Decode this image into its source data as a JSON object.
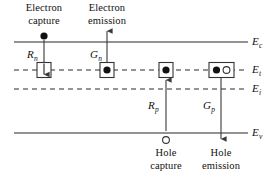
{
  "figure": {
    "background_color": "#ffffff",
    "line_color": "#6f6f6f",
    "dash_color": "#2a2a2a",
    "arrow_color": "#3a3a3a",
    "text_color": "#111111"
  },
  "energy_levels": [
    {
      "id": "Ec",
      "symbol": "E",
      "subscript": "c",
      "style": "solid",
      "y": 42,
      "x_start": 14,
      "x_end": 248,
      "label_x": 252,
      "label_y": 36
    },
    {
      "id": "Et",
      "symbol": "E",
      "subscript": "t",
      "style": "dashed",
      "y": 70,
      "x_start": 14,
      "x_end": 248,
      "label_x": 252,
      "label_y": 64
    },
    {
      "id": "Ei",
      "symbol": "E",
      "subscript": "i",
      "style": "dashed",
      "y": 89,
      "x_start": 14,
      "x_end": 248,
      "label_x": 252,
      "label_y": 83
    },
    {
      "id": "Ev",
      "symbol": "E",
      "subscript": "v",
      "style": "solid",
      "y": 133,
      "x_start": 14,
      "x_end": 248,
      "label_x": 252,
      "label_y": 127
    }
  ],
  "processes": [
    {
      "id": "electron-capture",
      "caption_line1": "Electron",
      "caption_line2": "capture",
      "caption_x": 44,
      "caption_y": 2,
      "rate_symbol": "R",
      "rate_subscript": "n",
      "rate_x": 28,
      "rate_y": 48,
      "carrier": "electron",
      "carrier_x": 44,
      "carrier_y": 36,
      "arrow_from_y": 42,
      "arrow_to_y": 70,
      "arrow_x": 44,
      "direction": "down"
    },
    {
      "id": "electron-emission",
      "caption_line1": "Electron",
      "caption_line2": "emission",
      "caption_x": 107,
      "caption_y": 2,
      "rate_symbol": "G",
      "rate_subscript": "n",
      "rate_x": 92,
      "rate_y": 48,
      "carrier": "none",
      "arrow_from_y": 64,
      "arrow_to_y": 30,
      "arrow_x": 107,
      "direction": "up"
    },
    {
      "id": "hole-capture",
      "caption_line1": "Hole",
      "caption_line2": "capture",
      "caption_x": 166,
      "caption_y": 148,
      "rate_symbol": "R",
      "rate_subscript": "p",
      "rate_x": 150,
      "rate_y": 100,
      "carrier": "hole",
      "carrier_x": 166,
      "carrier_y": 140,
      "arrow_from_y": 133,
      "arrow_to_y": 78,
      "arrow_x": 166,
      "direction": "up"
    },
    {
      "id": "hole-emission",
      "caption_line1": "Hole",
      "caption_line2": "emission",
      "caption_x": 221,
      "caption_y": 148,
      "rate_symbol": "G",
      "rate_subscript": "p",
      "rate_x": 205,
      "rate_y": 100,
      "carrier": "none",
      "arrow_from_y": 78,
      "arrow_to_y": 140,
      "arrow_x": 221,
      "direction": "down"
    }
  ],
  "trap_sites": [
    {
      "id": "trap-1",
      "x": 44,
      "y": 70,
      "w": 14,
      "h": 15,
      "content": "down-arrow"
    },
    {
      "id": "trap-2",
      "x": 107,
      "y": 70,
      "w": 14,
      "h": 15,
      "content": "electron"
    },
    {
      "id": "trap-3",
      "x": 166,
      "y": 70,
      "w": 14,
      "h": 15,
      "content": "electron"
    },
    {
      "id": "trap-4",
      "x": 221,
      "y": 70,
      "w": 25,
      "h": 15,
      "content": "electron-hole-pair"
    }
  ]
}
